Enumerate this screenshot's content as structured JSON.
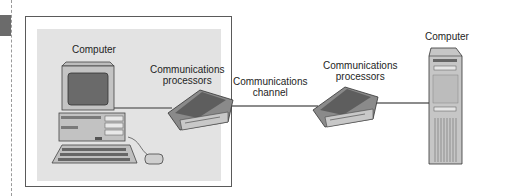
{
  "diagram": {
    "nodes": [
      {
        "id": "computer-left",
        "label": "Computer",
        "type": "desktop-computer"
      },
      {
        "id": "processor-left",
        "label_line1": "Communications",
        "label_line2": "processors",
        "type": "modem"
      },
      {
        "id": "channel",
        "label_line1": "Communications",
        "label_line2": "channel",
        "type": "link"
      },
      {
        "id": "processor-right",
        "label_line1": "Communications",
        "label_line2": "processors",
        "type": "modem"
      },
      {
        "id": "computer-right",
        "label": "Computer",
        "type": "tower-computer"
      }
    ],
    "edges": [
      {
        "from": "computer-left",
        "to": "processor-left"
      },
      {
        "from": "processor-left",
        "to": "processor-right",
        "label": "Communications channel"
      },
      {
        "from": "processor-right",
        "to": "computer-right"
      }
    ],
    "colors": {
      "panel": "#e2e2e2",
      "frame": "#555555",
      "device_dark": "#6e6e6e",
      "device_light": "#bdbdbd",
      "line": "#8a8a8a"
    }
  }
}
